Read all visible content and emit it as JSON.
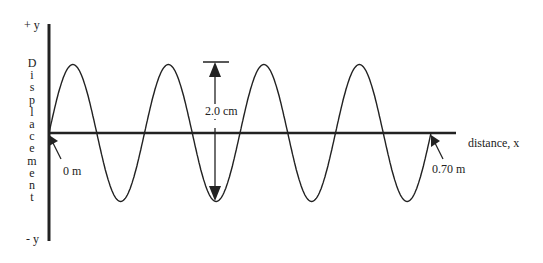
{
  "diagram": {
    "y_axis": {
      "top_label": "+ y",
      "bottom_label": "- y",
      "title_letters": [
        "D",
        "i",
        "s",
        "p",
        "l",
        "a",
        "c",
        "e",
        "m",
        "e",
        "n",
        "t"
      ],
      "title": "Displacement"
    },
    "x_axis": {
      "title": "distance, x"
    },
    "annotations": {
      "start": "0 m",
      "end": "0.70 m",
      "amplitude_span": "2.0 cm"
    },
    "wave": {
      "cycles": 4,
      "length_m": 0.7,
      "peak_to_trough_cm": 2.0
    },
    "colors": {
      "line": "#222222",
      "background": "#ffffff"
    }
  }
}
